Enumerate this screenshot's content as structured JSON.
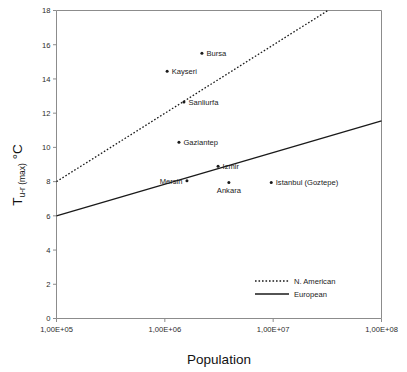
{
  "chart_data": {
    "type": "scatter",
    "title": "",
    "subtitle": "",
    "xlabel": "Population",
    "ylabel": "T u-r (max)  °C",
    "ylabel_main": "T",
    "ylabel_sub": "u-r (max)",
    "ylabel_tail": " °C",
    "xscale": "log",
    "xlim": [
      100000,
      100000000
    ],
    "ylim": [
      0,
      18
    ],
    "grid": false,
    "xticks": [
      100000,
      1000000,
      10000000,
      100000000
    ],
    "xtick_labels": [
      "1,00E+05",
      "1,00E+06",
      "1,00E+07",
      "1,00E+08"
    ],
    "yticks": [
      0,
      2,
      4,
      6,
      8,
      10,
      12,
      14,
      16,
      18
    ],
    "ytick_labels": [
      "0",
      "2",
      "4",
      "6",
      "8",
      "10",
      "12",
      "14",
      "16",
      "18"
    ],
    "points": [
      {
        "label": "Bursa",
        "x": 2200000,
        "y": 15.5,
        "label_side": "right"
      },
      {
        "label": "Kayseri",
        "x": 1050000,
        "y": 14.45,
        "label_side": "right"
      },
      {
        "label": "Sanliurfa",
        "x": 1500000,
        "y": 12.65,
        "label_side": "right"
      },
      {
        "label": "Gaziantep",
        "x": 1350000,
        "y": 10.3,
        "label_side": "right"
      },
      {
        "label": "Izmir",
        "x": 3100000,
        "y": 8.9,
        "label_side": "right"
      },
      {
        "label": "Mersin",
        "x": 1600000,
        "y": 8.05,
        "label_side": "left"
      },
      {
        "label": "Ankara",
        "x": 3900000,
        "y": 7.95,
        "label_side": "below"
      },
      {
        "label": "Istanbul (Goztepe)",
        "x": 9600000,
        "y": 7.95,
        "label_side": "right"
      }
    ],
    "series": [
      {
        "name": "N. American",
        "style": "dotted",
        "endpoints": [
          {
            "x": 100000,
            "y": 8.0
          },
          {
            "x": 32000000,
            "y": 18.0
          }
        ]
      },
      {
        "name": "European",
        "style": "solid",
        "endpoints": [
          {
            "x": 100000,
            "y": 6.0
          },
          {
            "x": 100000000,
            "y": 11.55
          }
        ]
      }
    ],
    "legend": {
      "position": "bottom-right",
      "entries": [
        {
          "label": "N. American",
          "style": "dotted"
        },
        {
          "label": "European",
          "style": "solid"
        }
      ]
    }
  }
}
